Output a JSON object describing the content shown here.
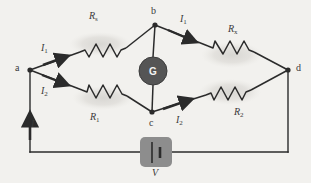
{
  "figure": {
    "background_color": "#f2f1ee",
    "wire_color": "#2b2b2b",
    "glow_color": "#dddcd9",
    "meter_fill": "#555555",
    "meter_text_color": "#f3f3f3",
    "battery_box_color": "#8d8d8d"
  },
  "nodes": [
    {
      "id": "a",
      "label": "a",
      "x": 30,
      "y": 70
    },
    {
      "id": "b",
      "label": "b",
      "x": 155,
      "y": 25
    },
    {
      "id": "c",
      "label": "c",
      "x": 152,
      "y": 112
    },
    {
      "id": "d",
      "label": "d",
      "x": 288,
      "y": 70
    }
  ],
  "components": {
    "r_standard": {
      "label": "R",
      "subscript": "s",
      "branch": "a-b"
    },
    "r_unknown": {
      "label": "R",
      "subscript": "x",
      "branch": "b-d"
    },
    "r_one": {
      "label": "R",
      "subscript": "1",
      "branch": "a-c"
    },
    "r_two": {
      "label": "R",
      "subscript": "2",
      "branch": "c-d"
    },
    "galvanometer": {
      "label": "G",
      "branch": "b-c"
    },
    "source": {
      "label": "V",
      "branch": "bottom"
    }
  },
  "currents": {
    "total": {
      "label": "I",
      "subscript": "",
      "branch": "left-rail"
    },
    "upper_left": {
      "label": "I",
      "subscript": "1",
      "branch": "a-b"
    },
    "upper_right": {
      "label": "I",
      "subscript": "1",
      "branch": "b-d"
    },
    "lower_left": {
      "label": "I",
      "subscript": "2",
      "branch": "a-c"
    },
    "lower_right": {
      "label": "I",
      "subscript": "2",
      "branch": "c-d"
    }
  }
}
